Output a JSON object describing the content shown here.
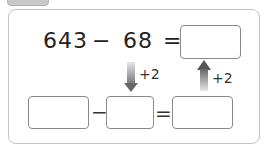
{
  "problem": {
    "operand1": "643",
    "operator": "−",
    "operand2": "68",
    "equals": "=",
    "result_box": ""
  },
  "transform": {
    "left_arrow_label": "+2",
    "right_arrow_label": "+2",
    "left_arrow_direction": "down",
    "right_arrow_direction": "up"
  },
  "rewrite": {
    "box1": "",
    "operator": "−",
    "box2": "",
    "equals": "=",
    "box3": ""
  }
}
